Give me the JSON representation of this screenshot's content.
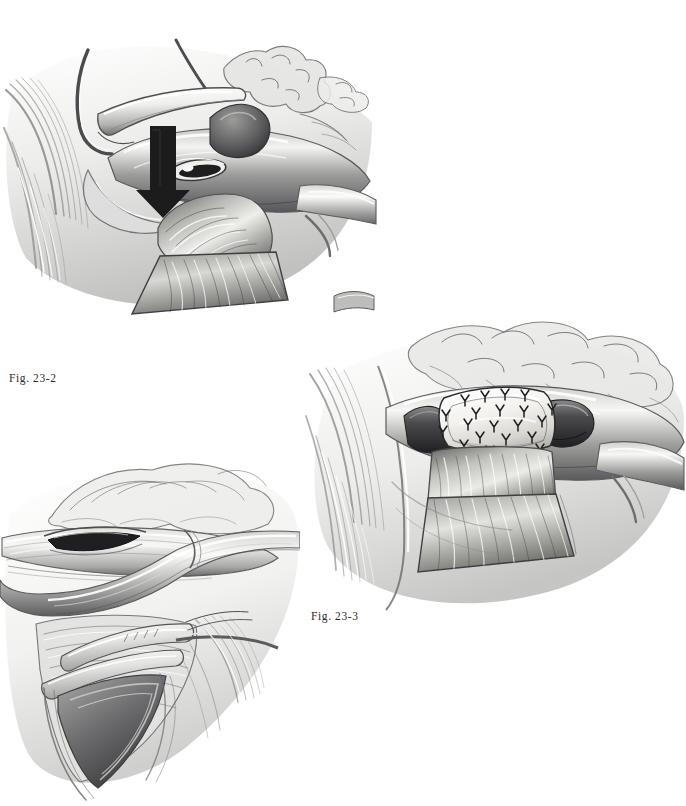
{
  "page": {
    "background_color": "#ffffff",
    "width": 686,
    "height": 806,
    "media": "grayscale pencil medical illustration",
    "ink_color": "#2b2b2b"
  },
  "captions": {
    "fig_23_2": "Fig. 23-2",
    "fig_23_3": "Fig. 23-3"
  },
  "figures": [
    {
      "id": "figure-23-2",
      "caption_key": "fig_23_2",
      "caption": "Fig. 23-2",
      "position": "top-left",
      "description": "Surgical exposure showing a retractor blade lifting tissue, an elliptical arteriotomy opening in the vessel, a solid black downward arrow indicating direction of the anastomosis, branching adipose and lymphatic tissue above, and a shaded tissue flap descending below the vessel."
    },
    {
      "id": "figure-23-3",
      "caption_key": "fig_23_3",
      "caption": "Fig. 23-3",
      "position": "middle-right",
      "description": "Completed repair: a pale oval patch graft sutured over the vessel with a ring of interrupted X-shaped suture knots, the vessel continuing to either side, fatty branching tissue above, and the tissue flap hanging below."
    },
    {
      "id": "figure-23-1b",
      "caption_key": null,
      "caption": "",
      "position": "bottom-left",
      "description": "Deeper operative field showing a linear arteriotomy in the upper vessel, an overlying looped vessel, and a surgical clamp or instrument engaging the structures within the exposed bed."
    }
  ],
  "elements": {
    "arrow_23_2": {
      "name": "direction-arrow",
      "color": "#1c1c1c",
      "direction": "down"
    },
    "patch_23_3": {
      "name": "patch-graft",
      "fill": "#efeeea",
      "suture_marks": 22,
      "suture_color": "#1f1f1f"
    }
  }
}
